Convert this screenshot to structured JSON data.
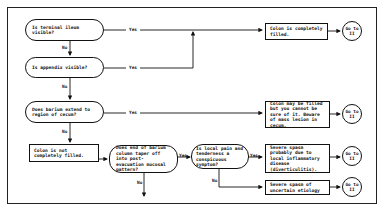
{
  "diagram": {
    "questions": [
      {
        "id": "q1",
        "text": "Is terminal ileum visible?"
      },
      {
        "id": "q2",
        "text": "Is appendix visible?"
      },
      {
        "id": "q3",
        "text": "Does barium extend to region of cecum?"
      },
      {
        "id": "q4",
        "text": "Does end of barium column taper off into post-evacuation mucosal pattern?"
      },
      {
        "id": "q5",
        "text": "Is local pain and tenderness a conspicuous symptom?"
      }
    ],
    "outcomes": [
      {
        "id": "o1",
        "text": "Colon is completely filled."
      },
      {
        "id": "o2",
        "text": "Colon may be filled but you cannot be sure of it. Beware of mass lesion in cecum."
      },
      {
        "id": "o3",
        "text": "Colon is not completely filled."
      },
      {
        "id": "o4",
        "text": "Severe spasm probably due to local inflammatory disease (diverticulitis)."
      },
      {
        "id": "o5",
        "text": "Severe spasm of uncertain etiology"
      }
    ],
    "goto": [
      {
        "id": "g1",
        "text": "Go to II"
      },
      {
        "id": "g2",
        "text": "Go to II"
      },
      {
        "id": "g3",
        "text": "Go to II"
      },
      {
        "id": "g4",
        "text": "Go to II"
      }
    ],
    "labels": {
      "yes": "Yes",
      "no": "No"
    }
  }
}
